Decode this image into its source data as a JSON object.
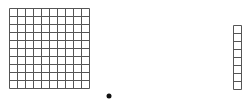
{
  "diagram": {
    "type": "base-ten-blocks",
    "line_color": "#555555",
    "dot_color": "#111111",
    "hundred_grid": {
      "rows": 10,
      "cols": 10,
      "x": 9,
      "y": 8,
      "cell": 8
    },
    "unit_dot": {
      "cx": 109,
      "cy": 96,
      "r": 2.5
    },
    "column_strip": {
      "rows": 8,
      "cols": 1,
      "x": 233,
      "y": 25,
      "cell": 8
    }
  }
}
